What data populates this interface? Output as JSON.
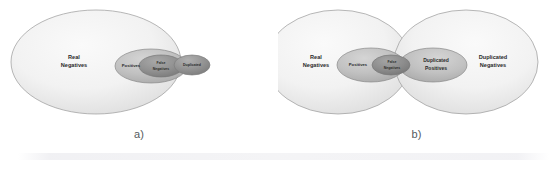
{
  "figure": {
    "width": 555,
    "height": 170,
    "background": "#ffffff"
  },
  "colors": {
    "outer_fill": "#f2f2f2",
    "outer_fill_edge": "#dcdcdc",
    "mid_fill": "#bdbdbd",
    "mid_fill_edge": "#a6a6a6",
    "dark_fill": "#8f8f8f",
    "dark_fill_edge": "#7a7a7a",
    "stroke": "#8c8c8c",
    "label_text": "#2b2b2b",
    "caption_text": "#555a5e"
  },
  "panels": [
    {
      "id": "a",
      "caption": "a)",
      "sets": [
        {
          "name": "real-negatives",
          "label_line1": "Real",
          "label_line2": "Negatives",
          "tone": "outer"
        },
        {
          "name": "positives",
          "label_line1": "Positives",
          "label_line2": "",
          "tone": "mid"
        },
        {
          "name": "false-negatives",
          "label_line1": "False",
          "label_line2": "Negatives",
          "tone": "dark"
        },
        {
          "name": "duplicated",
          "label_line1": "Duplicated",
          "label_line2": "",
          "tone": "dark"
        }
      ]
    },
    {
      "id": "b",
      "caption": "b)",
      "sets": [
        {
          "name": "real-negatives",
          "label_line1": "Real",
          "label_line2": "Negatives",
          "tone": "outer"
        },
        {
          "name": "positives",
          "label_line1": "Positives",
          "label_line2": "",
          "tone": "mid"
        },
        {
          "name": "false-negatives",
          "label_line1": "False",
          "label_line2": "Negatives",
          "tone": "dark"
        },
        {
          "name": "duplicated-positives",
          "label_line1": "Duplicated",
          "label_line2": "Positives",
          "tone": "mid"
        },
        {
          "name": "duplicated-negatives",
          "label_line1": "Duplicated",
          "label_line2": "Negatives",
          "tone": "outer"
        }
      ]
    }
  ],
  "labels": {
    "a": {
      "real_negatives_1": "Real",
      "real_negatives_2": "Negatives",
      "positives": "Positives",
      "false_negatives_1": "False",
      "false_negatives_2": "Negatives",
      "duplicated": "Duplicated"
    },
    "b": {
      "real_negatives_1": "Real",
      "real_negatives_2": "Negatives",
      "positives": "Positives",
      "false_negatives_1": "False",
      "false_negatives_2": "Negatives",
      "duplicated_positives_1": "Duplicated",
      "duplicated_positives_2": "Positives",
      "duplicated_negatives_1": "Duplicated",
      "duplicated_negatives_2": "Negatives"
    }
  },
  "captions": {
    "a": "a)",
    "b": "b)"
  }
}
